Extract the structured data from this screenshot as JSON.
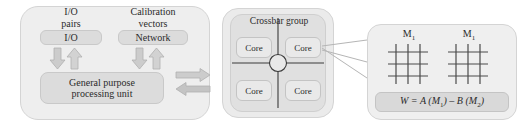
{
  "diagram": {
    "left_panel": {
      "captions": {
        "io_pairs": "I/O\npairs",
        "calibration_vectors": "Calibration\nvectors"
      },
      "io_box_label": "I/O",
      "network_box_label": "Network",
      "gpu_box_label": "General purpose\nprocessing unit"
    },
    "crossbar_panel": {
      "title": "Crossbar group",
      "cores": [
        {
          "label": "Core",
          "position": "top-left"
        },
        {
          "label": "Core",
          "position": "top-right"
        },
        {
          "label": "Core",
          "position": "bottom-left"
        },
        {
          "label": "Core",
          "position": "bottom-right"
        }
      ]
    },
    "detail_panel": {
      "matrix_labels": [
        "M",
        "M"
      ],
      "matrix_subscripts": [
        "1",
        "1"
      ],
      "grid_rows": 3,
      "grid_cols": 3,
      "equation": {
        "prefix": "W = A (M",
        "sub1": "1",
        "middle": ") – B (M",
        "sub2": "2",
        "suffix": ")"
      }
    },
    "colors": {
      "panel_fill": "#eeeeee",
      "inner_fill": "#e0e0e0",
      "box_fill": "#dcdcdc",
      "core_fill": "#e9e9e9",
      "equation_fill": "#d9d9d9",
      "arrow_fill": "#c9c9c9",
      "arrow_stroke": "#aaaaaa",
      "line_stroke": "#555555",
      "text": "#2b2b2b"
    }
  }
}
